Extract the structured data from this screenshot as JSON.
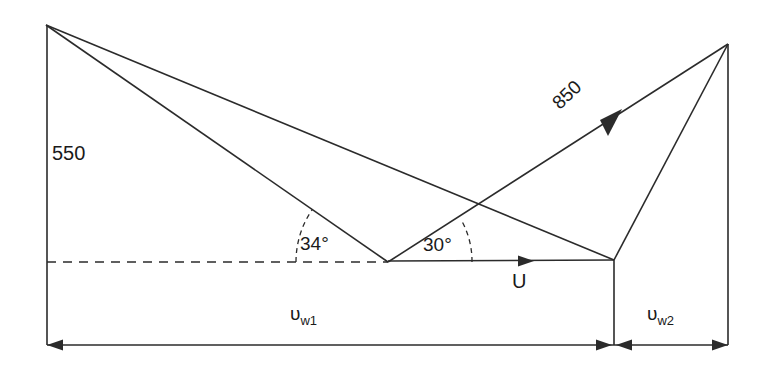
{
  "diagram": {
    "type": "velocity-triangle",
    "title": "",
    "background_color": "#ffffff",
    "line_color": "#2b2b2b",
    "text_color": "#1a1a1a",
    "labels": {
      "inlet_velocity": "550",
      "outlet_velocity": "850",
      "inlet_angle": "34°",
      "outlet_angle": "30°",
      "blade_speed": "U",
      "whirl1_symbol": "υ",
      "whirl1_subscript": "w1",
      "whirl2_symbol": "υ",
      "whirl2_subscript": "w2"
    },
    "geometry": {
      "left_apex": [
        46,
        25
      ],
      "right_apex": [
        728,
        44
      ],
      "mid_vertex": [
        388,
        262
      ],
      "right_base_vertex": [
        614,
        260
      ],
      "baseline_y": 261,
      "dimension_line_y": 345,
      "left_vertical_x": 47,
      "right_vertical_x": 728,
      "angle_arc_radius_34": 92,
      "angle_arc_radius_30": 84
    }
  }
}
